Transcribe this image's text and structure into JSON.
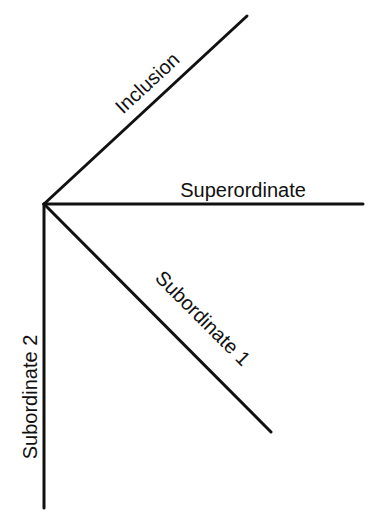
{
  "diagram": {
    "type": "radial-axes",
    "colors": {
      "background": "#ffffff",
      "stroke": "#111111",
      "text": "#111111"
    },
    "origin": {
      "x": 44,
      "y": 204
    },
    "axes": [
      {
        "id": "inclusion",
        "label": "Inclusion",
        "end": {
          "x": 247,
          "y": 16
        }
      },
      {
        "id": "superordinate",
        "label": "Superordinate",
        "end": {
          "x": 363,
          "y": 204
        }
      },
      {
        "id": "subordinate-1",
        "label": "Subordinate 1",
        "end": {
          "x": 271,
          "y": 432
        }
      },
      {
        "id": "subordinate-2",
        "label": "Subordinate 2",
        "end": {
          "x": 44,
          "y": 508
        }
      }
    ]
  }
}
